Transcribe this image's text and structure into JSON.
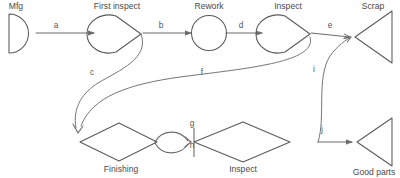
{
  "diagram": {
    "type": "process-flow-graph",
    "background_color": "#ffffff",
    "stroke_color": "#5a5a5a",
    "label_color": "#4a4a4a",
    "nodes": [
      {
        "id": "mfg",
        "label": "Mfg",
        "shape": "half-disc-right",
        "label_position": "above"
      },
      {
        "id": "first_inspect",
        "label": "First inspect",
        "shape": "teardrop-right",
        "label_position": "above"
      },
      {
        "id": "rework",
        "label": "Rework",
        "shape": "circle",
        "label_position": "above"
      },
      {
        "id": "inspect_top",
        "label": "Inspect",
        "shape": "teardrop-right",
        "label_position": "above"
      },
      {
        "id": "scrap",
        "label": "Scrap",
        "shape": "triangle-left",
        "label_position": "above"
      },
      {
        "id": "finishing",
        "label": "Finishing",
        "shape": "diamond",
        "label_position": "below"
      },
      {
        "id": "inspect_bot",
        "label": "Inspect",
        "shape": "diamond",
        "label_position": "below"
      },
      {
        "id": "good_parts",
        "label": "Good parts",
        "shape": "triangle-left",
        "label_position": "below"
      }
    ],
    "edges": [
      {
        "id": "a",
        "label": "a",
        "from": "mfg",
        "to": "first_inspect",
        "style": "straight-arrow"
      },
      {
        "id": "b",
        "label": "b",
        "from": "first_inspect",
        "to": "rework",
        "style": "straight-arrow"
      },
      {
        "id": "c",
        "label": "c",
        "from": "first_inspect",
        "to": "finishing",
        "style": "curve-arrow"
      },
      {
        "id": "d",
        "label": "d",
        "from": "rework",
        "to": "inspect_top",
        "style": "straight-arrow"
      },
      {
        "id": "e",
        "label": "e",
        "from": "inspect_top",
        "to": "scrap",
        "style": "straight-arrow"
      },
      {
        "id": "f",
        "label": "f",
        "from": "inspect_top",
        "to": "finishing",
        "style": "curve-arrow"
      },
      {
        "id": "g",
        "label": "g",
        "from": "finishing",
        "to": "inspect_bot",
        "style": "lens-upper-arrow"
      },
      {
        "id": "h",
        "label": "h",
        "from": "finishing",
        "to": "inspect_bot",
        "style": "lens-lower-arrow"
      },
      {
        "id": "i",
        "label": "i",
        "from": "inspect_bot",
        "to": "scrap",
        "style": "curve-arrow"
      },
      {
        "id": "j",
        "label": "j",
        "from": "inspect_bot",
        "to": "good_parts",
        "style": "straight-arrow"
      }
    ]
  },
  "labels": {
    "mfg": "Mfg",
    "first_inspect": "First inspect",
    "rework": "Rework",
    "inspect_top": "Inspect",
    "scrap": "Scrap",
    "finishing": "Finishing",
    "inspect_bot": "Inspect",
    "good_parts": "Good parts",
    "edge_a": "a",
    "edge_b": "b",
    "edge_c": "c",
    "edge_d": "d",
    "edge_e": "e",
    "edge_f": "f",
    "edge_g": "g",
    "edge_h": "h",
    "edge_i": "i",
    "edge_j": "j"
  }
}
